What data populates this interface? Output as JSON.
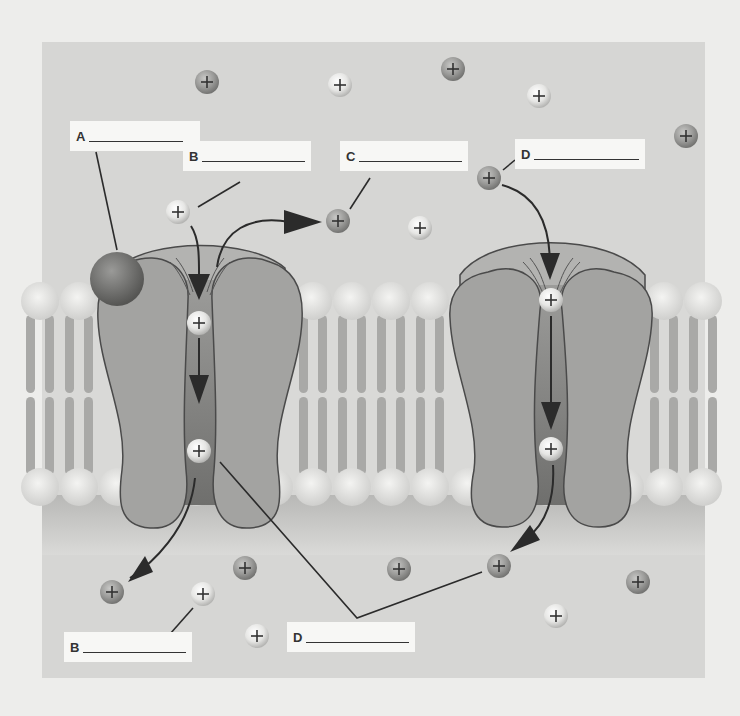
{
  "diagram": {
    "colors": {
      "page": "#ededeb",
      "panel": "#d6d6d4",
      "panel_lower": "#dcdcda",
      "protein": "#a3a3a1",
      "protein_dark": "#8a8a88",
      "protein_outline": "#4a4a4a",
      "channel_pore": "#7d7d7b",
      "lipid_head": "#e2e2e0",
      "lipid_tail": "#a9a9a7",
      "ligand": "#6e6e6c",
      "ion_light": "#e9e9e7",
      "ion_dark": "#9a9a98",
      "arrow": "#2b2b2b"
    },
    "labels": [
      {
        "id": "A-top",
        "letter": "A",
        "x": 70,
        "y": 121,
        "w": 130
      },
      {
        "id": "B-top",
        "letter": "B",
        "x": 183,
        "y": 141,
        "w": 128
      },
      {
        "id": "C-top",
        "letter": "C",
        "x": 340,
        "y": 141,
        "w": 128
      },
      {
        "id": "D-top",
        "letter": "D",
        "x": 515,
        "y": 139,
        "w": 130
      },
      {
        "id": "B-bottom",
        "letter": "B",
        "x": 64,
        "y": 632,
        "w": 128
      },
      {
        "id": "D-bottom",
        "letter": "D",
        "x": 287,
        "y": 622,
        "w": 128
      }
    ],
    "ions": [
      {
        "x": 207,
        "y": 82,
        "type": "dark"
      },
      {
        "x": 340,
        "y": 85,
        "type": "light"
      },
      {
        "x": 453,
        "y": 69,
        "type": "dark"
      },
      {
        "x": 539,
        "y": 96,
        "type": "light"
      },
      {
        "x": 686,
        "y": 136,
        "type": "dark"
      },
      {
        "x": 178,
        "y": 212,
        "type": "light"
      },
      {
        "x": 338,
        "y": 221,
        "type": "dark"
      },
      {
        "x": 420,
        "y": 228,
        "type": "light"
      },
      {
        "x": 489,
        "y": 178,
        "type": "dark"
      },
      {
        "x": 199,
        "y": 323,
        "type": "light"
      },
      {
        "x": 199,
        "y": 451,
        "type": "light"
      },
      {
        "x": 551,
        "y": 300,
        "type": "light"
      },
      {
        "x": 551,
        "y": 449,
        "type": "light"
      },
      {
        "x": 112,
        "y": 592,
        "type": "dark"
      },
      {
        "x": 203,
        "y": 594,
        "type": "light"
      },
      {
        "x": 245,
        "y": 568,
        "type": "dark"
      },
      {
        "x": 257,
        "y": 636,
        "type": "light"
      },
      {
        "x": 399,
        "y": 569,
        "type": "dark"
      },
      {
        "x": 499,
        "y": 566,
        "type": "dark"
      },
      {
        "x": 556,
        "y": 616,
        "type": "light"
      },
      {
        "x": 638,
        "y": 582,
        "type": "dark"
      }
    ]
  }
}
